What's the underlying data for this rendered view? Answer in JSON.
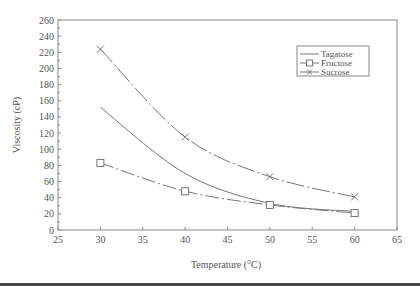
{
  "chart_data": {
    "type": "line",
    "title": "",
    "xlabel": "Temperature (°C)",
    "ylabel": "Viscosity (cP)",
    "xlim": [
      25,
      65
    ],
    "ylim": [
      0,
      260
    ],
    "xticks": [
      25,
      30,
      35,
      40,
      45,
      50,
      55,
      60,
      65
    ],
    "yticks": [
      0,
      20,
      40,
      60,
      80,
      100,
      120,
      140,
      160,
      180,
      200,
      220,
      240,
      260
    ],
    "grid": false,
    "legend_position": "upper right",
    "x": [
      30,
      40,
      50,
      60
    ],
    "series": [
      {
        "name": "Tagatose",
        "marker": "none",
        "values": [
          152,
          70,
          33,
          23
        ]
      },
      {
        "name": "Fructose",
        "marker": "square",
        "values": [
          83,
          48,
          31,
          21
        ]
      },
      {
        "name": "Sucrose",
        "marker": "x",
        "values": [
          224,
          115,
          66,
          41
        ]
      }
    ]
  },
  "colors": {
    "line": "#777777",
    "axis": "#888888",
    "text": "#555555"
  }
}
